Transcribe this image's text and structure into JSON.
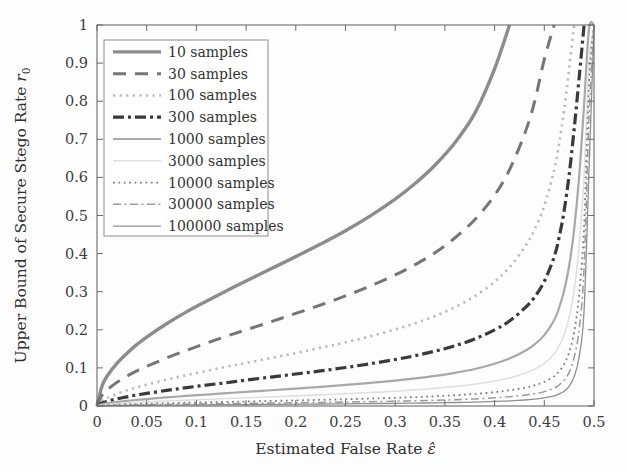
{
  "figure": {
    "background_color": "#fdfdfd",
    "axis_color": "#6b6b6b",
    "plot_area": {
      "left": 97,
      "top": 25,
      "right": 594,
      "bottom": 406
    }
  },
  "chart_data": {
    "type": "line",
    "title": "",
    "xlabel": "Estimated False Rate",
    "xlabel_symbol": "ε̂",
    "ylabel": "Upper Bound of Secure Stego Rate",
    "ylabel_symbol": "r",
    "ylabel_symbol_sub": "0",
    "xlim": [
      0,
      0.5
    ],
    "ylim": [
      0,
      1
    ],
    "grid": false,
    "legend_position": "top-left",
    "xticks": [
      0,
      0.05,
      0.1,
      0.15,
      0.2,
      0.25,
      0.3,
      0.35,
      0.4,
      0.45,
      0.5
    ],
    "xtick_labels": [
      "0",
      "0.05",
      "0.1",
      "0.15",
      "0.2",
      "0.25",
      "0.3",
      "0.35",
      "0.4",
      "0.45",
      "0.5"
    ],
    "yticks": [
      0,
      0.1,
      0.2,
      0.3,
      0.4,
      0.5,
      0.6,
      0.7,
      0.8,
      0.9,
      1
    ],
    "ytick_labels": [
      "0",
      "0.1",
      "0.2",
      "0.3",
      "0.4",
      "0.5",
      "0.6",
      "0.7",
      "0.8",
      "0.9",
      "1"
    ],
    "x": [
      0,
      0.005,
      0.01,
      0.02,
      0.03,
      0.04,
      0.05,
      0.07,
      0.09,
      0.11,
      0.13,
      0.15,
      0.175,
      0.2,
      0.225,
      0.25,
      0.275,
      0.3,
      0.32,
      0.34,
      0.36,
      0.38,
      0.4,
      0.415,
      0.43,
      0.44,
      0.45,
      0.46,
      0.465,
      0.47,
      0.475,
      0.48,
      0.485,
      0.49,
      0.495,
      0.5
    ],
    "series": [
      {
        "name": "10 samples",
        "label": "10 samples",
        "style": "solid",
        "color": "#8c8c8c",
        "width": 3.4,
        "dash": "none",
        "values": [
          0,
          0.052,
          0.078,
          0.112,
          0.138,
          0.161,
          0.181,
          0.216,
          0.247,
          0.275,
          0.302,
          0.328,
          0.36,
          0.392,
          0.425,
          0.46,
          0.499,
          0.543,
          0.584,
          0.632,
          0.691,
          0.768,
          0.885,
          1,
          1,
          1,
          1,
          1,
          1,
          1,
          1,
          1,
          1,
          1,
          1,
          1
        ]
      },
      {
        "name": "30 samples",
        "label": "30 samples",
        "style": "dashed",
        "color": "#757575",
        "width": 3.0,
        "dash": "13,9",
        "values": [
          0,
          0.028,
          0.042,
          0.062,
          0.078,
          0.092,
          0.104,
          0.126,
          0.146,
          0.165,
          0.183,
          0.2,
          0.221,
          0.243,
          0.265,
          0.289,
          0.315,
          0.344,
          0.371,
          0.402,
          0.441,
          0.489,
          0.553,
          0.62,
          0.713,
          0.796,
          0.91,
          1,
          1,
          1,
          1,
          1,
          1,
          1,
          1,
          1
        ]
      },
      {
        "name": "100 samples",
        "label": "100 samples",
        "style": "dotted",
        "color": "#b9b9b9",
        "width": 2.6,
        "dash": "2.2,4.4",
        "values": [
          0,
          0.014,
          0.021,
          0.032,
          0.041,
          0.049,
          0.056,
          0.069,
          0.081,
          0.092,
          0.103,
          0.113,
          0.126,
          0.139,
          0.153,
          0.167,
          0.183,
          0.201,
          0.217,
          0.236,
          0.259,
          0.288,
          0.326,
          0.364,
          0.416,
          0.462,
          0.526,
          0.62,
          0.69,
          0.778,
          0.886,
          1,
          1,
          1,
          1,
          1
        ]
      },
      {
        "name": "300 samples",
        "label": "300 samples",
        "style": "dash-dot",
        "color": "#3a3a3a",
        "width": 3.2,
        "dash": "11,4,3,4",
        "values": [
          0,
          0.008,
          0.012,
          0.019,
          0.024,
          0.029,
          0.033,
          0.041,
          0.048,
          0.055,
          0.061,
          0.068,
          0.076,
          0.084,
          0.092,
          0.101,
          0.111,
          0.122,
          0.132,
          0.144,
          0.158,
          0.176,
          0.2,
          0.223,
          0.256,
          0.285,
          0.327,
          0.392,
          0.444,
          0.513,
          0.607,
          0.726,
          0.86,
          1,
          1,
          1
        ]
      },
      {
        "name": "1000 samples",
        "label": "1000 samples",
        "style": "solid",
        "color": "#a8a8a8",
        "width": 2.2,
        "dash": "none",
        "values": [
          0,
          0.0045,
          0.0068,
          0.0104,
          0.0134,
          0.0159,
          0.0182,
          0.0226,
          0.0265,
          0.0301,
          0.0336,
          0.0371,
          0.0414,
          0.0458,
          0.0503,
          0.0552,
          0.0607,
          0.0668,
          0.0723,
          0.0791,
          0.0871,
          0.0972,
          0.111,
          0.1245,
          0.1437,
          0.161,
          0.186,
          0.2255,
          0.2585,
          0.303,
          0.368,
          0.463,
          0.6,
          0.79,
          0.99,
          1
        ]
      },
      {
        "name": "3000 samples",
        "label": "3000 samples",
        "style": "solid-faint",
        "color": "#e0e0e0",
        "width": 1.6,
        "dash": "none",
        "values": [
          0,
          0.0026,
          0.0039,
          0.006,
          0.0077,
          0.0092,
          0.0105,
          0.0131,
          0.0153,
          0.0174,
          0.0195,
          0.0215,
          0.024,
          0.0266,
          0.0292,
          0.0321,
          0.0353,
          0.0389,
          0.0422,
          0.0462,
          0.051,
          0.0571,
          0.0654,
          0.0736,
          0.0853,
          0.0961,
          0.1116,
          0.1366,
          0.158,
          0.1875,
          0.232,
          0.302,
          0.418,
          0.6,
          0.9,
          1
        ]
      },
      {
        "name": "10000 samples",
        "label": "10000 samples",
        "style": "dotted",
        "color": "#7d7d7d",
        "width": 1.8,
        "dash": "1.8,3.6",
        "values": [
          0,
          0.0014,
          0.0021,
          0.0033,
          0.0042,
          0.005,
          0.0058,
          0.0072,
          0.0084,
          0.0096,
          0.0107,
          0.0118,
          0.0132,
          0.0146,
          0.0161,
          0.0177,
          0.0195,
          0.0215,
          0.0233,
          0.0256,
          0.0283,
          0.0317,
          0.0364,
          0.0411,
          0.0478,
          0.0541,
          0.0632,
          0.0782,
          0.0914,
          0.11,
          0.1405,
          0.194,
          0.29,
          0.47,
          0.85,
          1
        ]
      },
      {
        "name": "30000 samples",
        "label": "30000 samples",
        "style": "dash-dot-thin",
        "color": "#9a9a9a",
        "width": 1.5,
        "dash": "8,3.5,2,3.5",
        "values": [
          0,
          0.0008,
          0.0012,
          0.0019,
          0.0024,
          0.0029,
          0.0034,
          0.0042,
          0.0049,
          0.0056,
          0.0062,
          0.0069,
          0.0077,
          0.0085,
          0.0094,
          0.0103,
          0.0114,
          0.0126,
          0.0137,
          0.015,
          0.0166,
          0.0187,
          0.0215,
          0.0243,
          0.0284,
          0.0322,
          0.0378,
          0.0472,
          0.0556,
          0.0676,
          0.0882,
          0.127,
          0.2,
          0.36,
          0.76,
          1
        ]
      },
      {
        "name": "100000 samples",
        "label": "100000 samples",
        "style": "solid-thin",
        "color": "#8f8f8f",
        "width": 1.3,
        "dash": "none",
        "values": [
          0,
          0.00045,
          0.00068,
          0.00105,
          0.00135,
          0.0016,
          0.00185,
          0.0023,
          0.0027,
          0.0031,
          0.0034,
          0.0038,
          0.0042,
          0.0047,
          0.0052,
          0.0057,
          0.0063,
          0.0069,
          0.0075,
          0.0083,
          0.0092,
          0.0103,
          0.0119,
          0.0135,
          0.0158,
          0.018,
          0.0212,
          0.0267,
          0.0317,
          0.039,
          0.0518,
          0.077,
          0.128,
          0.25,
          0.62,
          1
        ]
      }
    ]
  }
}
